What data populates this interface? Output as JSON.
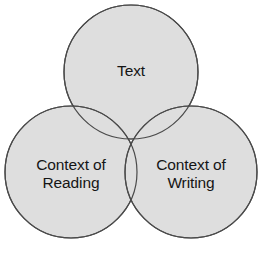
{
  "figure": {
    "type": "venn-diagram",
    "background_color": "#ffffff",
    "circle_fill_color": "#dedede",
    "circle_stroke_color": "#4a4a4a",
    "circle_stroke_width": 1.2,
    "label_color": "#151515",
    "circle_count": 3
  },
  "circles": [
    {
      "id": "text",
      "label": "Text",
      "cx": 131,
      "cy": 72,
      "r": 67
    },
    {
      "id": "context-of-reading",
      "label": "Context of\nReading",
      "cx": 71,
      "cy": 172,
      "r": 66
    },
    {
      "id": "context-of-writing",
      "label": "Context of\nWriting",
      "cx": 191,
      "cy": 172,
      "r": 66
    }
  ],
  "chart_data": {
    "type": "venn",
    "title": "",
    "sets": [
      "Text",
      "Context of Reading",
      "Context of Writing"
    ],
    "labels": [
      "Text",
      "Context of Reading",
      "Context of Writing"
    ],
    "overlaps": [
      [
        "Text",
        "Context of Reading"
      ],
      [
        "Text",
        "Context of Writing"
      ],
      [
        "Context of Reading",
        "Context of Writing"
      ],
      [
        "Text",
        "Context of Reading",
        "Context of Writing"
      ]
    ],
    "legend": "none",
    "grid": false
  }
}
